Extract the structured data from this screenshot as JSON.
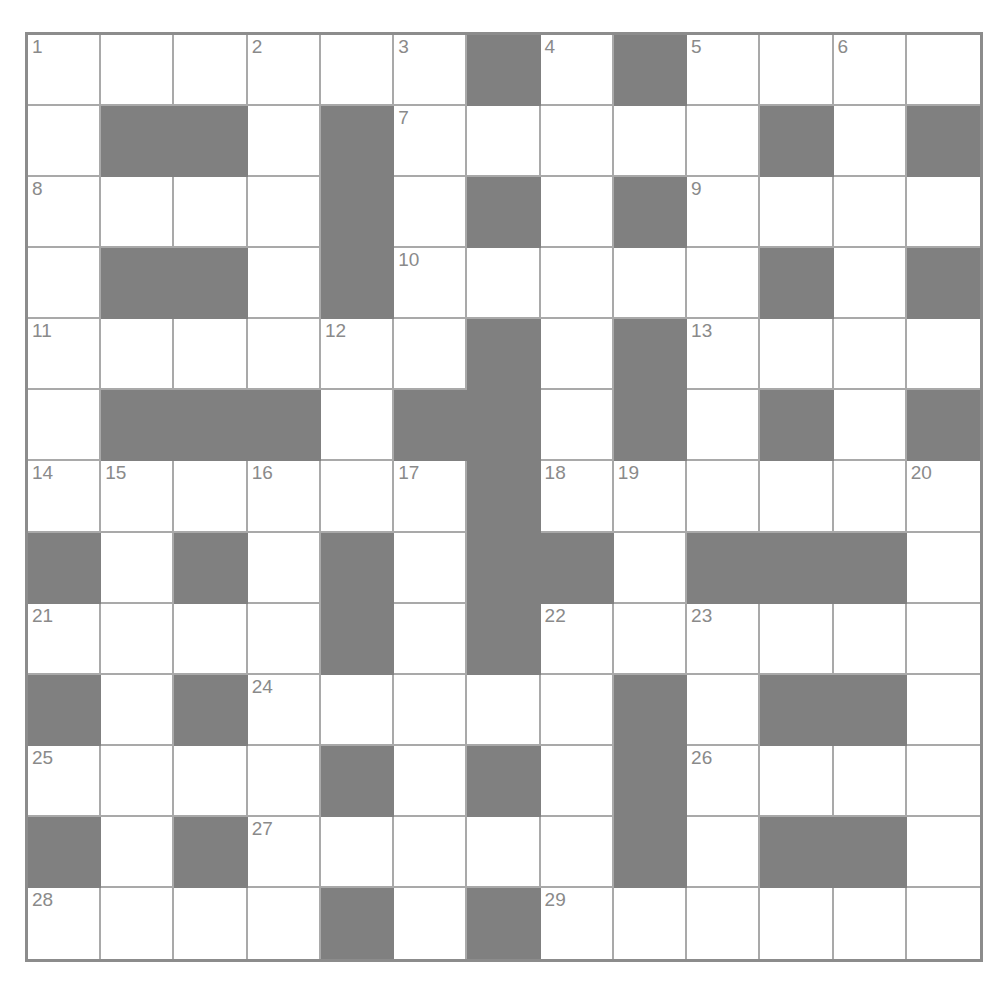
{
  "puzzle": {
    "type": "crossword-grid",
    "columns": 13,
    "rows": 13,
    "colors": {
      "blocked_cell": "#808080",
      "open_cell": "#ffffff",
      "grid_line": "#a9a9a9",
      "outer_border": "#8c8c8c",
      "number_text": "#8a8a8a",
      "page_background": "#ffffff"
    },
    "clue_numbers_present": [
      1,
      2,
      3,
      4,
      5,
      6,
      7,
      8,
      9,
      10,
      11,
      12,
      13,
      14,
      15,
      16,
      17,
      18,
      19,
      20,
      21,
      22,
      23,
      24,
      25,
      26,
      27,
      28,
      29
    ],
    "legend": {
      "open": "o",
      "blocked": "x"
    },
    "grid": [
      [
        "o",
        "o",
        "o",
        "o",
        "o",
        "o",
        "x",
        "o",
        "x",
        "o",
        "o",
        "o",
        "o"
      ],
      [
        "o",
        "x",
        "x",
        "o",
        "x",
        "o",
        "o",
        "o",
        "o",
        "o",
        "x",
        "o",
        "x"
      ],
      [
        "o",
        "o",
        "o",
        "o",
        "x",
        "o",
        "x",
        "o",
        "x",
        "o",
        "o",
        "o",
        "o"
      ],
      [
        "o",
        "x",
        "x",
        "o",
        "x",
        "o",
        "o",
        "o",
        "o",
        "o",
        "x",
        "o",
        "x"
      ],
      [
        "o",
        "o",
        "o",
        "o",
        "o",
        "o",
        "x",
        "o",
        "x",
        "o",
        "o",
        "o",
        "o"
      ],
      [
        "o",
        "x",
        "x",
        "x",
        "o",
        "x",
        "x",
        "o",
        "x",
        "o",
        "x",
        "o",
        "x"
      ],
      [
        "o",
        "o",
        "o",
        "o",
        "o",
        "o",
        "x",
        "o",
        "o",
        "o",
        "o",
        "o",
        "o"
      ],
      [
        "x",
        "o",
        "x",
        "o",
        "x",
        "o",
        "x",
        "x",
        "o",
        "x",
        "x",
        "x",
        "o"
      ],
      [
        "o",
        "o",
        "o",
        "o",
        "x",
        "o",
        "x",
        "o",
        "o",
        "o",
        "o",
        "o",
        "o"
      ],
      [
        "x",
        "o",
        "x",
        "o",
        "o",
        "o",
        "o",
        "o",
        "x",
        "o",
        "x",
        "x",
        "o"
      ],
      [
        "o",
        "o",
        "o",
        "o",
        "x",
        "o",
        "x",
        "o",
        "x",
        "o",
        "o",
        "o",
        "o"
      ],
      [
        "x",
        "o",
        "x",
        "o",
        "o",
        "o",
        "o",
        "o",
        "x",
        "o",
        "x",
        "x",
        "o"
      ],
      [
        "o",
        "o",
        "o",
        "o",
        "x",
        "o",
        "x",
        "o",
        "o",
        "o",
        "o",
        "o",
        "o"
      ]
    ],
    "numbers": [
      {
        "n": "1",
        "row": 0,
        "col": 0
      },
      {
        "n": "2",
        "row": 0,
        "col": 3
      },
      {
        "n": "3",
        "row": 0,
        "col": 5
      },
      {
        "n": "4",
        "row": 0,
        "col": 7
      },
      {
        "n": "5",
        "row": 0,
        "col": 9
      },
      {
        "n": "6",
        "row": 0,
        "col": 11
      },
      {
        "n": "7",
        "row": 1,
        "col": 5
      },
      {
        "n": "8",
        "row": 2,
        "col": 0
      },
      {
        "n": "9",
        "row": 2,
        "col": 9
      },
      {
        "n": "10",
        "row": 3,
        "col": 5
      },
      {
        "n": "11",
        "row": 4,
        "col": 0
      },
      {
        "n": "12",
        "row": 4,
        "col": 4
      },
      {
        "n": "13",
        "row": 4,
        "col": 9
      },
      {
        "n": "14",
        "row": 6,
        "col": 0
      },
      {
        "n": "15",
        "row": 6,
        "col": 1
      },
      {
        "n": "16",
        "row": 6,
        "col": 3
      },
      {
        "n": "17",
        "row": 6,
        "col": 5
      },
      {
        "n": "18",
        "row": 6,
        "col": 7
      },
      {
        "n": "19",
        "row": 6,
        "col": 8
      },
      {
        "n": "20",
        "row": 6,
        "col": 12
      },
      {
        "n": "21",
        "row": 8,
        "col": 0
      },
      {
        "n": "22",
        "row": 8,
        "col": 7
      },
      {
        "n": "23",
        "row": 8,
        "col": 9
      },
      {
        "n": "24",
        "row": 9,
        "col": 3
      },
      {
        "n": "25",
        "row": 10,
        "col": 0
      },
      {
        "n": "26",
        "row": 10,
        "col": 9
      },
      {
        "n": "27",
        "row": 11,
        "col": 3
      },
      {
        "n": "28",
        "row": 12,
        "col": 0
      },
      {
        "n": "29",
        "row": 12,
        "col": 7
      }
    ]
  }
}
